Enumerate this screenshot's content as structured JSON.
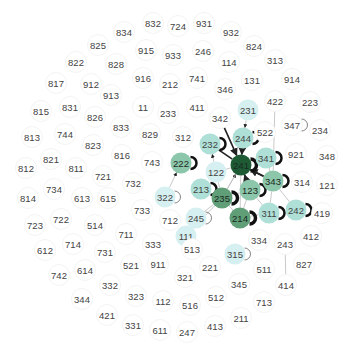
{
  "graph": {
    "type": "network",
    "colors": {
      "level0": "#ffffff",
      "level1": "#d6eff0",
      "level2": "#aee0d8",
      "level3": "#8dc7ab",
      "level4": "#5f9e77",
      "level5": "#1e5b35",
      "edge": "#bbbbbb",
      "edge_strong": "#222222",
      "loop": "#111111",
      "node_stroke": "#f0f0f0"
    },
    "nodes": [
      {
        "id": "832",
        "x": 153,
        "y": 23,
        "level": 0
      },
      {
        "id": "724",
        "x": 178,
        "y": 26,
        "level": 0
      },
      {
        "id": "931",
        "x": 204,
        "y": 23,
        "level": 0
      },
      {
        "id": "834",
        "x": 124,
        "y": 32,
        "level": 0
      },
      {
        "id": "932",
        "x": 231,
        "y": 32,
        "level": 0
      },
      {
        "id": "825",
        "x": 98,
        "y": 45,
        "level": 0
      },
      {
        "id": "915",
        "x": 146,
        "y": 50,
        "level": 0
      },
      {
        "id": "933",
        "x": 173,
        "y": 55,
        "level": 0
      },
      {
        "id": "246",
        "x": 203,
        "y": 51,
        "level": 0
      },
      {
        "id": "824",
        "x": 254,
        "y": 46,
        "level": 0
      },
      {
        "id": "822",
        "x": 76,
        "y": 62,
        "level": 0
      },
      {
        "id": "828",
        "x": 116,
        "y": 64,
        "level": 0
      },
      {
        "id": "114",
        "x": 229,
        "y": 62,
        "level": 0
      },
      {
        "id": "313",
        "x": 275,
        "y": 60,
        "level": 0
      },
      {
        "id": "817",
        "x": 56,
        "y": 83,
        "level": 0
      },
      {
        "id": "912",
        "x": 91,
        "y": 84,
        "level": 0
      },
      {
        "id": "916",
        "x": 143,
        "y": 78,
        "level": 0
      },
      {
        "id": "212",
        "x": 170,
        "y": 84,
        "level": 0
      },
      {
        "id": "741",
        "x": 197,
        "y": 78,
        "level": 0
      },
      {
        "id": "346",
        "x": 225,
        "y": 89,
        "level": 0
      },
      {
        "id": "131",
        "x": 252,
        "y": 80,
        "level": 0
      },
      {
        "id": "914",
        "x": 292,
        "y": 79,
        "level": 0
      },
      {
        "id": "913",
        "x": 111,
        "y": 95,
        "level": 0
      },
      {
        "id": "815",
        "x": 41,
        "y": 111,
        "level": 0
      },
      {
        "id": "831",
        "x": 70,
        "y": 107,
        "level": 0
      },
      {
        "id": "11",
        "x": 143,
        "y": 107,
        "level": 0
      },
      {
        "id": "233",
        "x": 168,
        "y": 113,
        "level": 0
      },
      {
        "id": "411",
        "x": 197,
        "y": 107,
        "level": 0
      },
      {
        "id": "422",
        "x": 275,
        "y": 101,
        "level": 0
      },
      {
        "id": "223",
        "x": 310,
        "y": 102,
        "level": 0
      },
      {
        "id": "826",
        "x": 95,
        "y": 117,
        "level": 0
      },
      {
        "id": "342",
        "x": 220,
        "y": 118,
        "level": 0
      },
      {
        "id": "231",
        "x": 248,
        "y": 110,
        "level": 1
      },
      {
        "id": "347",
        "x": 292,
        "y": 125,
        "level": 0
      },
      {
        "id": "234",
        "x": 320,
        "y": 130,
        "level": 0
      },
      {
        "id": "833",
        "x": 121,
        "y": 127,
        "level": 0
      },
      {
        "id": "522",
        "x": 265,
        "y": 132,
        "level": 0
      },
      {
        "id": "813",
        "x": 32,
        "y": 137,
        "level": 0
      },
      {
        "id": "744",
        "x": 65,
        "y": 134,
        "level": 0
      },
      {
        "id": "829",
        "x": 150,
        "y": 134,
        "level": 0
      },
      {
        "id": "312",
        "x": 183,
        "y": 137,
        "level": 0
      },
      {
        "id": "244",
        "x": 243,
        "y": 138,
        "level": 2
      },
      {
        "id": "232",
        "x": 210,
        "y": 144,
        "level": 2
      },
      {
        "id": "823",
        "x": 93,
        "y": 145,
        "level": 0
      },
      {
        "id": "921",
        "x": 296,
        "y": 154,
        "level": 0
      },
      {
        "id": "348",
        "x": 327,
        "y": 156,
        "level": 0
      },
      {
        "id": "821",
        "x": 51,
        "y": 159,
        "level": 0
      },
      {
        "id": "816",
        "x": 122,
        "y": 155,
        "level": 0
      },
      {
        "id": "743",
        "x": 152,
        "y": 162,
        "level": 0
      },
      {
        "id": "341",
        "x": 266,
        "y": 158,
        "level": 2
      },
      {
        "id": "812",
        "x": 26,
        "y": 168,
        "level": 0
      },
      {
        "id": "811",
        "x": 76,
        "y": 168,
        "level": 0
      },
      {
        "id": "222",
        "x": 181,
        "y": 163,
        "level": 3
      },
      {
        "id": "241",
        "x": 241,
        "y": 165,
        "level": 5
      },
      {
        "id": "122",
        "x": 216,
        "y": 172,
        "level": 1
      },
      {
        "id": "721",
        "x": 103,
        "y": 176,
        "level": 0
      },
      {
        "id": "732",
        "x": 133,
        "y": 183,
        "level": 0
      },
      {
        "id": "343",
        "x": 273,
        "y": 181,
        "level": 3
      },
      {
        "id": "314",
        "x": 302,
        "y": 182,
        "level": 0
      },
      {
        "id": "121",
        "x": 327,
        "y": 185,
        "level": 0
      },
      {
        "id": "213",
        "x": 201,
        "y": 189,
        "level": 2
      },
      {
        "id": "123",
        "x": 250,
        "y": 190,
        "level": 3
      },
      {
        "id": "734",
        "x": 54,
        "y": 189,
        "level": 0
      },
      {
        "id": "322",
        "x": 165,
        "y": 197,
        "level": 1
      },
      {
        "id": "235",
        "x": 222,
        "y": 198,
        "level": 4
      },
      {
        "id": "814",
        "x": 28,
        "y": 198,
        "level": 0
      },
      {
        "id": "613",
        "x": 82,
        "y": 198,
        "level": 0
      },
      {
        "id": "615",
        "x": 108,
        "y": 198,
        "level": 0
      },
      {
        "id": "733",
        "x": 142,
        "y": 210,
        "level": 0
      },
      {
        "id": "712",
        "x": 170,
        "y": 220,
        "level": 0
      },
      {
        "id": "245",
        "x": 196,
        "y": 218,
        "level": 1
      },
      {
        "id": "214",
        "x": 240,
        "y": 218,
        "level": 4
      },
      {
        "id": "311",
        "x": 269,
        "y": 213,
        "level": 2
      },
      {
        "id": "242",
        "x": 296,
        "y": 210,
        "level": 2
      },
      {
        "id": "419",
        "x": 322,
        "y": 213,
        "level": 0
      },
      {
        "id": "723",
        "x": 35,
        "y": 225,
        "level": 0
      },
      {
        "id": "722",
        "x": 61,
        "y": 219,
        "level": 0
      },
      {
        "id": "514",
        "x": 95,
        "y": 225,
        "level": 0
      },
      {
        "id": "111",
        "x": 186,
        "y": 236,
        "level": 1
      },
      {
        "id": "334",
        "x": 259,
        "y": 240,
        "level": 0
      },
      {
        "id": "243",
        "x": 285,
        "y": 244,
        "level": 0
      },
      {
        "id": "412",
        "x": 311,
        "y": 236,
        "level": 0
      },
      {
        "id": "711",
        "x": 126,
        "y": 234,
        "level": 0
      },
      {
        "id": "612",
        "x": 45,
        "y": 250,
        "level": 0
      },
      {
        "id": "714",
        "x": 73,
        "y": 244,
        "level": 0
      },
      {
        "id": "731",
        "x": 105,
        "y": 252,
        "level": 0
      },
      {
        "id": "333",
        "x": 153,
        "y": 244,
        "level": 0
      },
      {
        "id": "513",
        "x": 192,
        "y": 249,
        "level": 0
      },
      {
        "id": "315",
        "x": 235,
        "y": 254,
        "level": 1
      },
      {
        "id": "221",
        "x": 210,
        "y": 267,
        "level": 0
      },
      {
        "id": "511",
        "x": 264,
        "y": 269,
        "level": 0
      },
      {
        "id": "827",
        "x": 304,
        "y": 264,
        "level": 0
      },
      {
        "id": "742",
        "x": 59,
        "y": 275,
        "level": 0
      },
      {
        "id": "614",
        "x": 85,
        "y": 270,
        "level": 0
      },
      {
        "id": "521",
        "x": 131,
        "y": 265,
        "level": 0
      },
      {
        "id": "911",
        "x": 158,
        "y": 264,
        "level": 0
      },
      {
        "id": "321",
        "x": 185,
        "y": 277,
        "level": 0
      },
      {
        "id": "345",
        "x": 239,
        "y": 284,
        "level": 0
      },
      {
        "id": "414",
        "x": 286,
        "y": 285,
        "level": 0
      },
      {
        "id": "332",
        "x": 110,
        "y": 285,
        "level": 0
      },
      {
        "id": "344",
        "x": 82,
        "y": 299,
        "level": 0
      },
      {
        "id": "323",
        "x": 136,
        "y": 296,
        "level": 0
      },
      {
        "id": "112",
        "x": 163,
        "y": 301,
        "level": 0
      },
      {
        "id": "516",
        "x": 190,
        "y": 305,
        "level": 0
      },
      {
        "id": "512",
        "x": 216,
        "y": 297,
        "level": 0
      },
      {
        "id": "713",
        "x": 264,
        "y": 302,
        "level": 0
      },
      {
        "id": "421",
        "x": 107,
        "y": 315,
        "level": 0
      },
      {
        "id": "211",
        "x": 241,
        "y": 318,
        "level": 0
      },
      {
        "id": "331",
        "x": 133,
        "y": 325,
        "level": 0
      },
      {
        "id": "611",
        "x": 160,
        "y": 330,
        "level": 0
      },
      {
        "id": "247",
        "x": 187,
        "y": 332,
        "level": 0
      },
      {
        "id": "413",
        "x": 215,
        "y": 326,
        "level": 0
      }
    ],
    "loops": [
      "244",
      "232",
      "341",
      "222",
      "343",
      "213",
      "123",
      "322",
      "235",
      "245",
      "214",
      "311",
      "242",
      "347",
      "315",
      "241"
    ],
    "edges": [
      {
        "source": "342",
        "target": "241",
        "strong": true,
        "arrow": true
      },
      {
        "source": "231",
        "target": "244",
        "strong": false,
        "arrow": true
      },
      {
        "source": "244",
        "target": "241",
        "strong": true,
        "arrow": true
      },
      {
        "source": "232",
        "target": "241",
        "strong": true,
        "arrow": false
      },
      {
        "source": "122",
        "target": "232",
        "strong": false,
        "arrow": true
      },
      {
        "source": "322",
        "target": "222",
        "strong": false,
        "arrow": true
      },
      {
        "source": "422",
        "target": "343",
        "strong": false,
        "arrow": false
      },
      {
        "source": "341",
        "target": "241",
        "strong": false,
        "arrow": false
      },
      {
        "source": "343",
        "target": "241",
        "strong": true,
        "arrow": true
      },
      {
        "source": "241",
        "target": "343",
        "strong": true,
        "arrow": false
      },
      {
        "source": "123",
        "target": "241",
        "strong": true,
        "arrow": true
      },
      {
        "source": "235",
        "target": "241",
        "strong": false,
        "arrow": true
      },
      {
        "source": "214",
        "target": "241",
        "strong": false,
        "arrow": false
      },
      {
        "source": "122",
        "target": "241",
        "strong": false,
        "arrow": false
      },
      {
        "source": "235",
        "target": "122",
        "strong": false,
        "arrow": false
      },
      {
        "source": "235",
        "target": "123",
        "strong": false,
        "arrow": false
      },
      {
        "source": "235",
        "target": "245",
        "strong": false,
        "arrow": false
      },
      {
        "source": "235",
        "target": "111",
        "strong": false,
        "arrow": false
      },
      {
        "source": "235",
        "target": "214",
        "strong": false,
        "arrow": false
      },
      {
        "source": "123",
        "target": "343",
        "strong": false,
        "arrow": false
      },
      {
        "source": "123",
        "target": "311",
        "strong": false,
        "arrow": false
      },
      {
        "source": "123",
        "target": "214",
        "strong": false,
        "arrow": false
      },
      {
        "source": "343",
        "target": "311",
        "strong": false,
        "arrow": false
      },
      {
        "source": "343",
        "target": "242",
        "strong": false,
        "arrow": false
      },
      {
        "source": "341",
        "target": "343",
        "strong": false,
        "arrow": false
      },
      {
        "source": "214",
        "target": "311",
        "strong": false,
        "arrow": false
      },
      {
        "source": "243",
        "target": "414",
        "strong": false,
        "arrow": false
      },
      {
        "source": "241",
        "target": "235",
        "strong": false,
        "arrow": false
      }
    ]
  }
}
